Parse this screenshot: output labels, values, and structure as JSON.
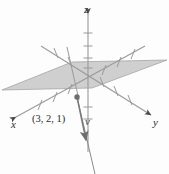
{
  "figure": {
    "type": "3d-coordinate-diagram",
    "title": "",
    "background_color": "#fdfdfd",
    "axes": [
      {
        "name": "x",
        "label": "x",
        "label_x": 13,
        "label_y": 125,
        "direction": "front-left",
        "arrow": true
      },
      {
        "name": "y",
        "label": "y",
        "label_x": 155,
        "label_y": 122,
        "direction": "front-right",
        "arrow": true
      },
      {
        "name": "z",
        "label": "z",
        "label_x": 86,
        "label_y": 12,
        "direction": "up",
        "arrow": true
      }
    ],
    "plane": {
      "name": "shaded-plane",
      "fill_color": "#b9b9b9",
      "opacity": 0.72,
      "stroke_color": "#8f8f8f",
      "points": "2,90 72,62 167,60 92,88"
    },
    "point": {
      "label": "(3, 2, 1)",
      "label_x": 34,
      "label_y": 119,
      "dot_x": 77,
      "dot_y": 97,
      "dot_radius": 2.6,
      "dot_color": "#6d6d6d"
    },
    "vector": {
      "label": "v",
      "label_x": 88,
      "label_y": 122,
      "color": "#7a7a7a",
      "from_x": 77,
      "from_y": 97,
      "to_x": 86,
      "to_y": 144,
      "tail_x": 94,
      "tail_y": 174
    },
    "origin": {
      "x": 88,
      "y": 78
    },
    "line_color": "#9a9a9a",
    "tick_color": "#9a9a9a",
    "axis_lines": [
      {
        "name": "x-axis-line",
        "x1": 14,
        "y1": 118,
        "x2": 145,
        "y2": 46
      },
      {
        "name": "y-axis-line",
        "x1": 40,
        "y1": 45,
        "x2": 152,
        "y2": 116
      },
      {
        "name": "z-axis-line",
        "x1": 88,
        "y1": 12,
        "x2": 88,
        "y2": 152
      },
      {
        "name": "plane-edge-line",
        "x1": 67,
        "y1": 48,
        "x2": 79,
        "y2": 99
      }
    ],
    "ticks": {
      "x_axis": [
        0.18,
        0.3,
        0.42,
        0.62,
        0.74,
        0.86
      ],
      "y_axis": [
        0.14,
        0.26,
        0.38,
        0.62,
        0.74,
        0.86
      ],
      "z_axis": [
        0.14,
        0.24,
        0.34,
        0.44,
        0.62,
        0.72
      ]
    }
  }
}
